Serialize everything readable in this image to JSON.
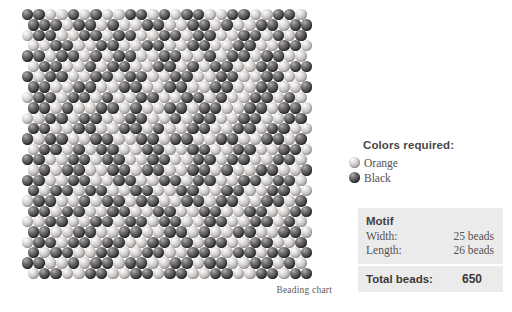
{
  "chart": {
    "caption": "Beading chart",
    "bead_size_px": 11.4,
    "row_height_px": 10.35,
    "colors": {
      "orange": "#bdb9b7",
      "black": "#4b4a4a"
    },
    "rows": [
      "1100101001101011001100110",
      "1110110100110011010011011",
      "0110011011001101100110101",
      "0011001100110011001100110",
      "1101101011001100101101100",
      "0110010110011010110011011",
      "1011001101100110011001100",
      "1100110011001100110011001",
      "0110110100110011010011010",
      "1101001101001101100110110",
      "0011011001100101100110011",
      "1100110011010011001101100",
      "1011001100110110011001101",
      "0110101100110011001100110",
      "1100110110011001101100110",
      "0101100110110011010011001",
      "1100110011001101100110110",
      "1011011001100110011001100",
      "0110010110110011011001101",
      "1101100110011001100110011",
      "0011001101101100110011010",
      "1100110011001101001100110",
      "0110110110011010110011001",
      "1011001100110011001101101",
      "1100101101100110110011010",
      "0110011001101100110011011"
    ]
  },
  "colors_required": {
    "title": "Colors required:",
    "items": [
      {
        "name": "Orange",
        "swatch": "orange"
      },
      {
        "name": "Black",
        "swatch": "black"
      }
    ]
  },
  "motif": {
    "heading": "Motif",
    "rows": [
      {
        "key": "Width:",
        "value": "25 beads"
      },
      {
        "key": "Length:",
        "value": "26 beads"
      }
    ],
    "total_label": "Total beads:",
    "total_value": "650"
  }
}
